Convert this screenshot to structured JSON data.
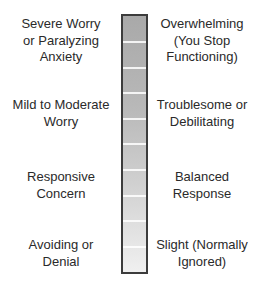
{
  "left_labels": [
    {
      "lines": [
        "Severe Worry",
        "or Paralyzing",
        "Anxiety"
      ]
    },
    {
      "lines": [
        "Mild to Moderate",
        "Worry"
      ]
    },
    {
      "lines": [
        "Responsive",
        "Concern"
      ]
    },
    {
      "lines": [
        "Avoiding or",
        "Denial"
      ]
    }
  ],
  "right_labels": [
    {
      "lines": [
        "Overwhelming",
        "(You Stop",
        "Functioning)"
      ]
    },
    {
      "lines": [
        "Troublesome or",
        "Debilitating"
      ]
    },
    {
      "lines": [
        "Balanced",
        "Response"
      ]
    },
    {
      "lines": [
        "Slight (Normally",
        "Ignored)"
      ]
    }
  ],
  "scale": {
    "segments": 10,
    "gradient_top_color": "#a9a9a9",
    "gradient_bottom_color": "#f0f0f0",
    "border_color": "#3c3c3c"
  }
}
